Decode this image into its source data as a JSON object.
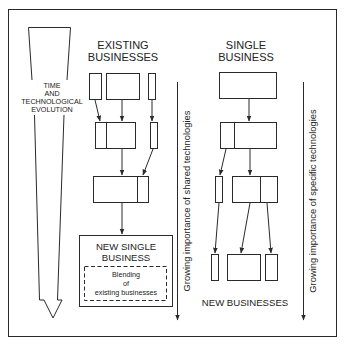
{
  "diagram": {
    "time_arrow": {
      "lines": [
        "TIME",
        "AND",
        "TECHNOLOGICAL",
        "EVOLUTION"
      ]
    },
    "existing": {
      "title_line1": "EXISTING",
      "title_line2": "BUSINESSES",
      "result_title_line1": "NEW SINGLE",
      "result_title_line2": "BUSINESS",
      "blend_lines": [
        "Blending",
        "of",
        "existing businesses"
      ]
    },
    "shared_axis_label": "Growing importance of shared technologies",
    "single": {
      "title_line1": "SINGLE",
      "title_line2": "BUSINESS",
      "result_label": "NEW BUSINESSES"
    },
    "specific_axis_label": "Growing importance of specific technologies",
    "colors": {
      "line": "#2a2a2a",
      "background": "#ffffff"
    }
  }
}
